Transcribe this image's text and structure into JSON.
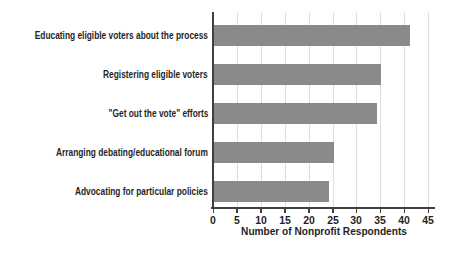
{
  "chart_data": {
    "type": "bar",
    "orientation": "horizontal",
    "title": "",
    "xlabel": "Number of Nonprofit Respondents",
    "ylabel": "",
    "categories": [
      "Educating eligible voters about the process",
      "Registering eligible voters",
      "\"Get out the vote\" efforts",
      "Arranging debating/educational forum",
      "Advocating for particular policies"
    ],
    "values": [
      41,
      35,
      34,
      25,
      24
    ],
    "xlim": [
      0,
      45
    ],
    "xticks": [
      0,
      5,
      10,
      15,
      20,
      25,
      30,
      35,
      40,
      45
    ],
    "grid": true,
    "legend": false,
    "bar_color": "#8a8a8a",
    "gridline_color": "#dedede",
    "axis_color": "#3f3f3f",
    "text_color": "#1f1f1f"
  }
}
